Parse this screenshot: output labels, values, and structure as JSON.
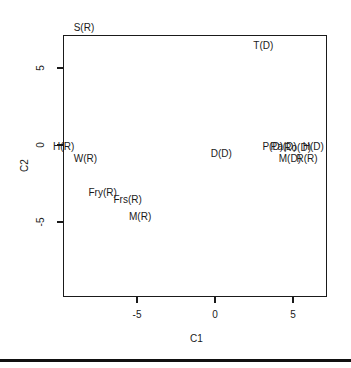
{
  "chart_data": {
    "type": "scatter",
    "title": "",
    "xlabel": "C1",
    "ylabel": "C2",
    "xlim": [
      -9.8,
      7.2
    ],
    "ylim": [
      -9.8,
      7.3
    ],
    "x_ticks": [
      -5,
      0,
      5
    ],
    "y_ticks": [
      -5,
      0,
      5
    ],
    "x_tick_labels": [
      "-5",
      "0",
      "5"
    ],
    "y_tick_labels": [
      "-5",
      "0",
      "5"
    ],
    "grid": false,
    "legend": null,
    "points": [
      {
        "label": "S(R)",
        "x": -8.4,
        "y": 7.6
      },
      {
        "label": "T(D)",
        "x": 3.1,
        "y": 6.4
      },
      {
        "label": "H(R)",
        "x": -9.7,
        "y": -0.1
      },
      {
        "label": "W(R)",
        "x": -8.3,
        "y": -0.9
      },
      {
        "label": "D(D)",
        "x": 0.4,
        "y": -0.6
      },
      {
        "label": "P(D)",
        "x": 3.7,
        "y": -0.1
      },
      {
        "label": "Pa(D)",
        "x": 4.4,
        "y": -0.1
      },
      {
        "label": "Ro(D)",
        "x": 5.3,
        "y": -0.2
      },
      {
        "label": "H(D)",
        "x": 6.3,
        "y": -0.1
      },
      {
        "label": "M(D)",
        "x": 4.8,
        "y": -0.9
      },
      {
        "label": "R(R)",
        "x": 5.9,
        "y": -0.9
      },
      {
        "label": "Fry(R)",
        "x": -7.2,
        "y": -3.1
      },
      {
        "label": "Frs(R)",
        "x": -5.6,
        "y": -3.6
      },
      {
        "label": "M(R)",
        "x": -4.8,
        "y": -4.7
      }
    ]
  }
}
